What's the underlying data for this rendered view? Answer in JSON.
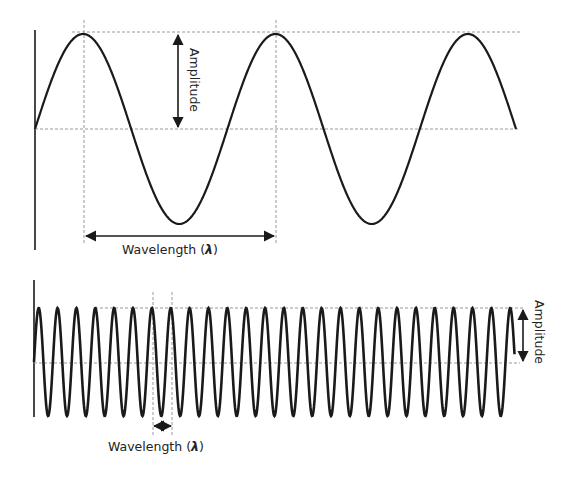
{
  "diagram": {
    "top_wave": {
      "description": "Low-frequency sine wave (long wavelength)",
      "amplitude_label": "Amplitude",
      "wavelength_label": "Wavelength (",
      "lambda_symbol": "λ",
      "close_paren": ")",
      "cycles_shown": 2.5
    },
    "bottom_wave": {
      "description": "High-frequency sine wave (short wavelength)",
      "amplitude_label": "Amplitude",
      "wavelength_label": "Wavelength (",
      "lambda_symbol": "λ",
      "close_paren": ")",
      "cycles_shown": 25.5
    },
    "colors": {
      "wave": "#1a1a1a",
      "guide_dashes": "#999999",
      "text": "#222222"
    }
  }
}
